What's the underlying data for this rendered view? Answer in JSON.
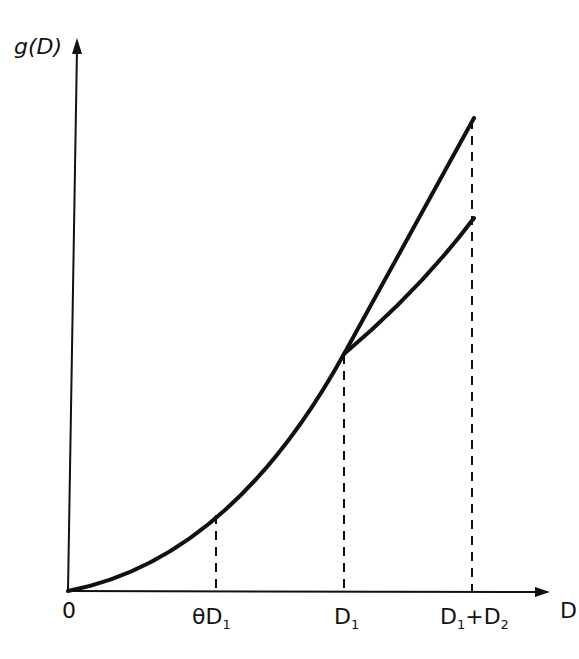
{
  "diagram": {
    "y_axis_label": "g(D)",
    "x_axis_label": "D",
    "origin_label": "0",
    "ticks": [
      {
        "label": "θD",
        "sub": "1"
      },
      {
        "label": "D",
        "sub": "1"
      },
      {
        "label": "D",
        "sub": "1",
        "mid": "+D",
        "sub2": "2"
      }
    ],
    "curves": [
      {
        "name": "convex g(D) continuing",
        "from": "0",
        "to": "D1+D2 (upper)"
      },
      {
        "name": "linear/concave branch after D1",
        "from": "D1",
        "to": "D1+D2 (lower)"
      }
    ],
    "dashed_guides": [
      "θD1",
      "D1",
      "D1+D2"
    ],
    "colors": {
      "ink": "#111111",
      "background": "#ffffff"
    }
  }
}
